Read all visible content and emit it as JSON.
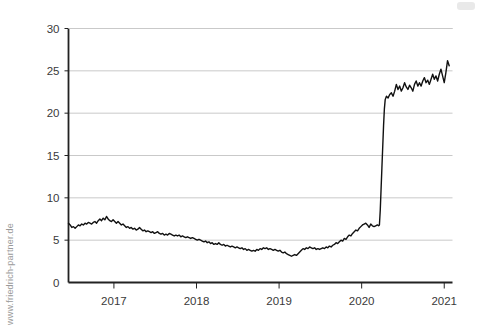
{
  "watermark": {
    "text": "www.friedrich-partner.de"
  },
  "chart_data": {
    "type": "line",
    "title": "",
    "subtitle": "",
    "xlabel": "",
    "ylabel": "",
    "xlim": [
      2016.45,
      2021.1
    ],
    "ylim": [
      0,
      30
    ],
    "grid": true,
    "grid_axis": "y",
    "legend": "none",
    "line_color": "#111111",
    "line_width": 1.4,
    "grid_color": "#c9c9c9",
    "axis_color": "#222222",
    "background": "#ffffff",
    "y_ticks": [
      0,
      5,
      10,
      15,
      20,
      25,
      30
    ],
    "y_tick_labels": [
      "0",
      "5",
      "10",
      "15",
      "20",
      "25",
      "30"
    ],
    "x_ticks": [
      2017,
      2018,
      2019,
      2020,
      2021
    ],
    "x_tick_labels": [
      "2017",
      "2018",
      "2019",
      "2020",
      "2021"
    ],
    "series": [
      {
        "name": "series-1",
        "x": [
          2016.45,
          2016.47,
          2016.49,
          2016.51,
          2016.53,
          2016.55,
          2016.57,
          2016.59,
          2016.61,
          2016.63,
          2016.65,
          2016.67,
          2016.69,
          2016.71,
          2016.73,
          2016.75,
          2016.77,
          2016.79,
          2016.81,
          2016.83,
          2016.85,
          2016.87,
          2016.89,
          2016.91,
          2016.93,
          2016.95,
          2016.97,
          2016.99,
          2017.01,
          2017.03,
          2017.05,
          2017.07,
          2017.09,
          2017.11,
          2017.13,
          2017.15,
          2017.17,
          2017.19,
          2017.21,
          2017.23,
          2017.25,
          2017.27,
          2017.29,
          2017.31,
          2017.33,
          2017.35,
          2017.37,
          2017.39,
          2017.41,
          2017.43,
          2017.45,
          2017.47,
          2017.49,
          2017.51,
          2017.53,
          2017.55,
          2017.57,
          2017.59,
          2017.61,
          2017.63,
          2017.65,
          2017.67,
          2017.69,
          2017.71,
          2017.73,
          2017.75,
          2017.77,
          2017.79,
          2017.81,
          2017.83,
          2017.85,
          2017.87,
          2017.89,
          2017.91,
          2017.93,
          2017.95,
          2017.97,
          2017.99,
          2018.01,
          2018.03,
          2018.05,
          2018.07,
          2018.09,
          2018.11,
          2018.13,
          2018.15,
          2018.17,
          2018.19,
          2018.21,
          2018.23,
          2018.25,
          2018.27,
          2018.29,
          2018.31,
          2018.33,
          2018.35,
          2018.37,
          2018.39,
          2018.41,
          2018.43,
          2018.45,
          2018.47,
          2018.49,
          2018.51,
          2018.53,
          2018.55,
          2018.57,
          2018.59,
          2018.61,
          2018.63,
          2018.65,
          2018.67,
          2018.69,
          2018.71,
          2018.73,
          2018.75,
          2018.77,
          2018.79,
          2018.81,
          2018.83,
          2018.85,
          2018.87,
          2018.89,
          2018.91,
          2018.93,
          2018.95,
          2018.97,
          2018.99,
          2019.01,
          2019.03,
          2019.05,
          2019.07,
          2019.09,
          2019.11,
          2019.13,
          2019.15,
          2019.17,
          2019.19,
          2019.21,
          2019.23,
          2019.25,
          2019.27,
          2019.29,
          2019.31,
          2019.33,
          2019.35,
          2019.37,
          2019.39,
          2019.41,
          2019.43,
          2019.45,
          2019.47,
          2019.49,
          2019.51,
          2019.53,
          2019.55,
          2019.57,
          2019.59,
          2019.61,
          2019.63,
          2019.65,
          2019.67,
          2019.69,
          2019.71,
          2019.73,
          2019.75,
          2019.77,
          2019.79,
          2019.81,
          2019.83,
          2019.85,
          2019.87,
          2019.89,
          2019.91,
          2019.93,
          2019.95,
          2019.97,
          2019.99,
          2020.01,
          2020.03,
          2020.05,
          2020.07,
          2020.09,
          2020.11,
          2020.13,
          2020.15,
          2020.17,
          2020.19,
          2020.205,
          2020.215,
          2020.225,
          2020.235,
          2020.245,
          2020.255,
          2020.265,
          2020.275,
          2020.285,
          2020.3,
          2020.32,
          2020.34,
          2020.36,
          2020.38,
          2020.4,
          2020.42,
          2020.44,
          2020.46,
          2020.48,
          2020.5,
          2020.52,
          2020.54,
          2020.56,
          2020.58,
          2020.6,
          2020.62,
          2020.64,
          2020.66,
          2020.68,
          2020.7,
          2020.72,
          2020.74,
          2020.76,
          2020.78,
          2020.8,
          2020.82,
          2020.84,
          2020.86,
          2020.88,
          2020.9,
          2020.92,
          2020.94,
          2020.96,
          2020.98,
          2021.0,
          2021.02,
          2021.04,
          2021.06
        ],
        "values": [
          7.0,
          6.8,
          6.5,
          6.6,
          6.4,
          6.6,
          6.8,
          6.7,
          6.9,
          6.8,
          7.0,
          6.9,
          7.1,
          7.0,
          6.9,
          7.1,
          7.2,
          7.0,
          7.3,
          7.5,
          7.3,
          7.6,
          7.4,
          7.8,
          7.5,
          7.3,
          7.2,
          7.4,
          7.2,
          7.0,
          7.2,
          7.0,
          6.8,
          6.9,
          6.7,
          6.5,
          6.6,
          6.4,
          6.5,
          6.3,
          6.4,
          6.2,
          6.3,
          6.5,
          6.3,
          6.1,
          6.2,
          6.0,
          6.1,
          6.0,
          5.9,
          6.0,
          5.8,
          5.9,
          6.0,
          5.8,
          5.7,
          5.8,
          5.6,
          5.7,
          5.6,
          5.8,
          5.7,
          5.6,
          5.5,
          5.6,
          5.5,
          5.6,
          5.4,
          5.5,
          5.4,
          5.3,
          5.4,
          5.3,
          5.2,
          5.3,
          5.2,
          5.1,
          5.0,
          5.1,
          5.0,
          4.9,
          4.8,
          4.9,
          4.7,
          4.8,
          4.6,
          4.7,
          4.5,
          4.6,
          4.5,
          4.7,
          4.5,
          4.4,
          4.5,
          4.3,
          4.4,
          4.3,
          4.2,
          4.3,
          4.2,
          4.1,
          4.2,
          4.1,
          4.0,
          4.1,
          3.9,
          4.0,
          3.8,
          3.9,
          3.8,
          3.7,
          3.8,
          3.7,
          3.9,
          3.8,
          4.0,
          3.9,
          4.1,
          4.0,
          4.1,
          3.9,
          4.0,
          3.9,
          3.8,
          3.9,
          3.8,
          3.7,
          3.8,
          3.6,
          3.5,
          3.6,
          3.4,
          3.3,
          3.2,
          3.1,
          3.2,
          3.3,
          3.2,
          3.4,
          3.6,
          3.8,
          4.0,
          3.9,
          4.1,
          4.0,
          4.2,
          4.1,
          4.0,
          4.1,
          3.9,
          4.0,
          3.9,
          4.0,
          4.1,
          4.0,
          4.2,
          4.1,
          4.3,
          4.2,
          4.4,
          4.5,
          4.7,
          4.6,
          4.8,
          5.0,
          4.9,
          5.2,
          5.1,
          5.4,
          5.6,
          5.5,
          5.8,
          6.0,
          6.2,
          6.1,
          6.4,
          6.6,
          6.8,
          6.9,
          7.0,
          6.8,
          6.5,
          6.9,
          6.7,
          6.6,
          6.7,
          6.8,
          6.7,
          6.8,
          8.5,
          11.0,
          13.5,
          16.0,
          18.5,
          20.5,
          21.6,
          22.0,
          21.8,
          22.2,
          22.4,
          22.0,
          22.6,
          23.4,
          22.8,
          23.2,
          22.6,
          23.0,
          23.6,
          23.1,
          22.8,
          23.3,
          23.0,
          22.6,
          23.4,
          23.8,
          23.2,
          23.6,
          23.2,
          23.8,
          24.2,
          23.6,
          23.9,
          23.4,
          24.0,
          24.6,
          24.0,
          24.4,
          23.8,
          24.6,
          25.2,
          24.4,
          23.6,
          24.8,
          26.2,
          25.6
        ]
      }
    ]
  }
}
